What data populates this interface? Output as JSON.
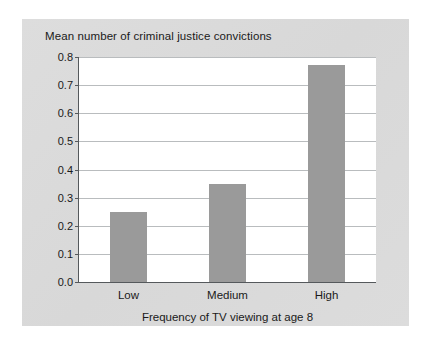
{
  "chart_data": {
    "type": "bar",
    "title": "Mean number of criminal justice convictions",
    "xlabel": "Frequency of TV viewing at age 8",
    "ylabel": "",
    "categories": [
      "Low",
      "Medium",
      "High"
    ],
    "values": [
      0.25,
      0.35,
      0.77
    ],
    "ylim": [
      0.0,
      0.8
    ],
    "ytick_labels": [
      "0.8",
      "0.7",
      "0.6",
      "0.5",
      "0.4",
      "0.3",
      "0.2",
      "0.1",
      "0.0"
    ],
    "ytick_values": [
      0.8,
      0.7,
      0.6,
      0.5,
      0.4,
      0.3,
      0.2,
      0.1,
      0.0
    ],
    "grid": true,
    "legend": false,
    "legend_position": "none",
    "bar_color": "#9a9a9a",
    "plot_background": "#ffffff",
    "panel_background": "#dcdcdc",
    "axis_color": "#55595c",
    "gridline_color": "#b9bcbe",
    "text_color": "#1a1a1a"
  }
}
